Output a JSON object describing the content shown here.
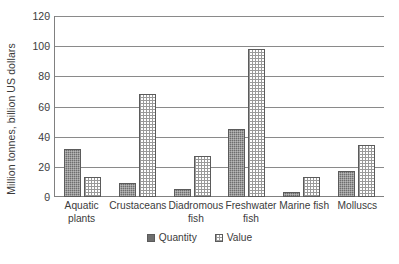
{
  "chart_data": {
    "type": "bar",
    "title": "",
    "xlabel": "",
    "ylabel": "Million tonnes, billion US dollars",
    "ylim": [
      0,
      120
    ],
    "yticks": [
      0,
      20,
      40,
      60,
      80,
      100,
      120
    ],
    "ytick_labels": [
      "0",
      "20",
      "40",
      "60",
      "80",
      "100",
      "120"
    ],
    "grid": true,
    "legend_position": "bottom",
    "categories": [
      "Aquatic plants",
      "Crustaceans",
      "Diadromous fish",
      "Freshwater fish",
      "Marine fish",
      "Molluscs"
    ],
    "category_lines": [
      [
        "Aquatic",
        "plants"
      ],
      [
        "Crustaceans"
      ],
      [
        "Diadromous",
        "fish"
      ],
      [
        "Freshwater",
        "fish"
      ],
      [
        "Marine fish"
      ],
      [
        "Molluscs"
      ]
    ],
    "series": [
      {
        "name": "Quantity",
        "fill": "dark-hatch",
        "color": "#6e6e6e",
        "values": [
          32,
          9,
          5,
          45,
          3,
          17
        ]
      },
      {
        "name": "Value",
        "fill": "light-dotted",
        "color": "#ffffff",
        "values": [
          13.5,
          68,
          27.5,
          98,
          13,
          34.5
        ]
      }
    ]
  },
  "legend": {
    "items": [
      {
        "label": "Quantity"
      },
      {
        "label": "Value"
      }
    ]
  }
}
